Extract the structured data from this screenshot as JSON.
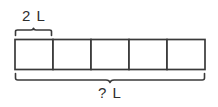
{
  "diagram": {
    "type": "tape-diagram",
    "kind": "bar-model",
    "unit_count": 5,
    "part_label": "2 L",
    "total_label": "? L",
    "part_value": 2,
    "part_unit": "L",
    "total_value": "?",
    "total_unit": "L",
    "part_brace_covers_units": 1,
    "total_brace_covers_units": 5,
    "stroke_color": "#3a3a3a",
    "text_color": "#2e2e2e",
    "background_color": "#ffffff",
    "cells": [
      {
        "index": 1,
        "label": ""
      },
      {
        "index": 2,
        "label": ""
      },
      {
        "index": 3,
        "label": ""
      },
      {
        "index": 4,
        "label": ""
      },
      {
        "index": 5,
        "label": ""
      }
    ]
  }
}
